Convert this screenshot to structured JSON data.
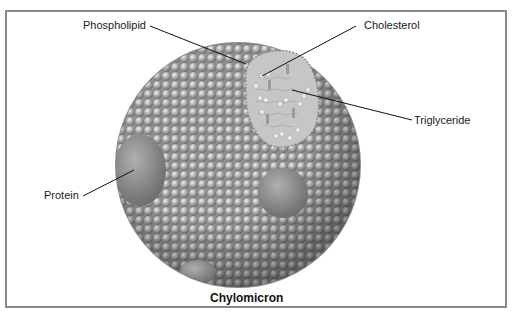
{
  "figure": {
    "title": "Chylomicron",
    "labels": {
      "phospholipid": "Phospholipid",
      "cholesterol": "Cholesterol",
      "triglyceride": "Triglyceride",
      "protein": "Protein"
    },
    "colors": {
      "frame": "#8a8a8a",
      "sphere": "#a8a8a8",
      "core": "#c4c4c4",
      "leader": "#111111"
    }
  }
}
